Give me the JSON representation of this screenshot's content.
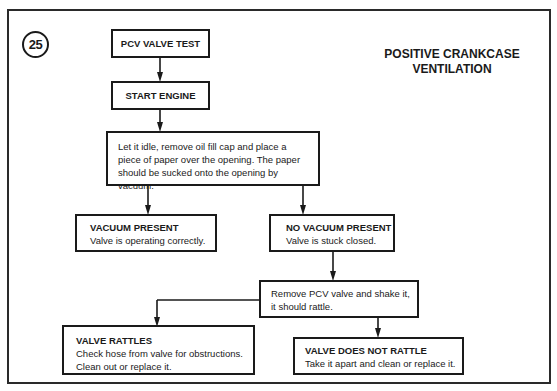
{
  "diagram": {
    "figure_number": "25",
    "title_line1": "POSITIVE CRANKCASE",
    "title_line2": "VENTILATION",
    "nodes": {
      "start": {
        "label": "PCV VALVE TEST"
      },
      "engine": {
        "label": "START ENGINE"
      },
      "idle": {
        "text": "Let it idle, remove oil fill cap and place a piece of paper over the opening. The paper should be sucked onto the opening by vacuum."
      },
      "vacuum_present": {
        "heading": "VACUUM PRESENT",
        "text": "Valve is operating correctly."
      },
      "no_vacuum": {
        "heading": "NO VACUUM PRESENT",
        "text": "Valve is stuck closed."
      },
      "shake": {
        "text": "Remove PCV valve and shake it, it should rattle."
      },
      "rattles": {
        "heading": "VALVE RATTLES",
        "text": "Check hose from valve for obstructions. Clean out or replace it."
      },
      "no_rattle": {
        "heading": "VALVE DOES NOT RATTLE",
        "text": "Take it apart and clean or replace it."
      }
    },
    "edges": [
      [
        "start",
        "engine"
      ],
      [
        "engine",
        "idle"
      ],
      [
        "idle",
        "vacuum_present"
      ],
      [
        "idle",
        "no_vacuum"
      ],
      [
        "no_vacuum",
        "shake"
      ],
      [
        "shake",
        "rattles"
      ],
      [
        "shake",
        "no_rattle"
      ]
    ],
    "colors": {
      "line": "#1a1a1a",
      "background": "#ffffff"
    }
  }
}
